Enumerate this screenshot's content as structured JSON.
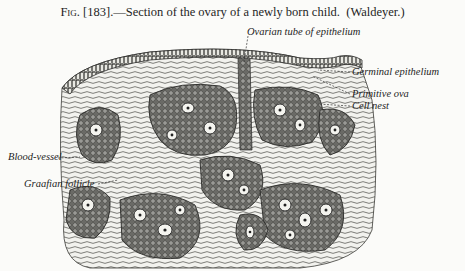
{
  "caption": {
    "figure_prefix": "Fig.",
    "figure_number": "[183].",
    "text": "—Section of the ovary of a newly born child.",
    "attribution": "(Waldeyer.)"
  },
  "labels": {
    "ovarian_tube": "Ovarian tube of epithelium",
    "germinal_epithelium": "Germinal epithelium",
    "primitive_ova": "Primitive ova",
    "cell_nest": "Cell nest",
    "blood_vessel": "Blood-vessel",
    "graafian_follicle": "Graafian follicle"
  },
  "colors": {
    "paper": "#fbfbf9",
    "ink": "#1e1e1e"
  }
}
